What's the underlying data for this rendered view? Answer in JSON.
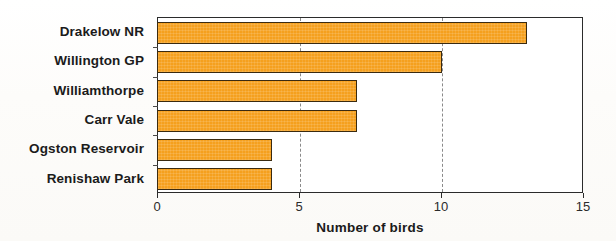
{
  "chart_data": {
    "type": "bar",
    "orientation": "horizontal",
    "title": "",
    "xlabel": "Number of birds",
    "ylabel": "",
    "categories": [
      "Drakelow NR",
      "Willington GP",
      "Williamthorpe",
      "Carr Vale",
      "Ogston Reservoir",
      "Renishaw Park"
    ],
    "values": [
      13,
      10,
      7,
      7,
      4,
      4
    ],
    "xlim": [
      0,
      15
    ],
    "xticks": [
      0,
      5,
      10,
      15
    ],
    "xtick_labels": [
      "0",
      "5",
      "10",
      "15"
    ],
    "gridlines": [
      5,
      10
    ],
    "grid": true,
    "grid_style": "dashed",
    "legend": null,
    "bar_color": "#f5a01e",
    "bar_edge_color": "#3a2a10",
    "axis_color": "#2b2b2b",
    "background_color": "#ffffff"
  }
}
